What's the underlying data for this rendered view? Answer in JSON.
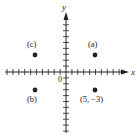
{
  "diagram": {
    "type": "coordinate-plane",
    "axes": {
      "x_label": "x",
      "y_label": "y",
      "origin_label": "0",
      "x_range": [
        -10,
        10
      ],
      "y_range": [
        -10,
        10
      ],
      "tick_step": 1
    },
    "points": [
      {
        "id": "a",
        "label": "(a)",
        "x": 5,
        "y": 3
      },
      {
        "id": "c",
        "label": "(c)",
        "x": -5,
        "y": 3
      },
      {
        "id": "b",
        "label": "(b)",
        "x": -5,
        "y": -3
      },
      {
        "id": "d",
        "label": "(5, −3)",
        "x": 5,
        "y": -3
      }
    ],
    "colors": {
      "ink": "#222222",
      "background": "#ffffff"
    }
  }
}
